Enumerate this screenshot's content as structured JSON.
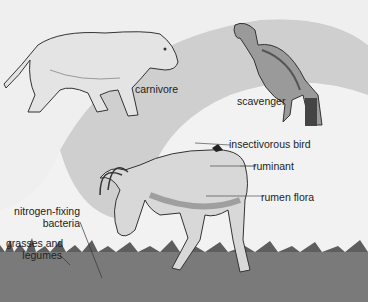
{
  "diagram": {
    "type": "food-web illustration",
    "colors": {
      "background": "#f2f2f2",
      "band": "#cfcfcf",
      "ground": "#7a7a7a",
      "grass": "#5e5e5e",
      "ink": "#222222"
    },
    "labels": {
      "carnivore": "carnivore",
      "scavenger": "scavenger",
      "insectivorous_bird": "insectivorous bird",
      "ruminant": "ruminant",
      "rumen_flora": "rumen flora",
      "nitrogen_fixing_line1": "nitrogen-fixing",
      "nitrogen_fixing_line2": "bacteria",
      "grasses_line1": "grasses and",
      "grasses_line2": "legumes"
    },
    "organisms": [
      "lioness",
      "vulture",
      "antelope",
      "small bird",
      "grass"
    ]
  }
}
